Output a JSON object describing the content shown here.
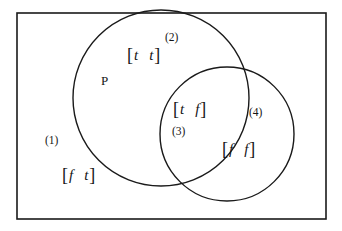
{
  "figure": {
    "type": "venn-euler-diagram",
    "background_color": "#ffffff",
    "stroke_color": "#1a1a1a",
    "universe": {
      "shape": "rectangle",
      "x": 17,
      "y": 13,
      "width": 309,
      "height": 206,
      "stroke_width": 1.6
    },
    "circles": [
      {
        "name": "left-circle",
        "label": "P",
        "cx": 161,
        "cy": 98,
        "r": 88,
        "stroke_width": 1.4
      },
      {
        "name": "right-circle",
        "label": "",
        "cx": 227,
        "cy": 134,
        "r": 67,
        "stroke_width": 1.4
      }
    ],
    "set_label": {
      "text": "P",
      "x": 101,
      "y": 74
    },
    "regions": [
      {
        "id": "1",
        "number_text": "(1)",
        "number_x": 45,
        "number_y": 135,
        "pair_text": "[f  t]",
        "left_bracket": "[",
        "right_bracket": "]",
        "first_value": "f",
        "second_value": "t",
        "pair_x": 62,
        "pair_y": 166,
        "description": "outside both circles"
      },
      {
        "id": "2",
        "number_text": "(2)",
        "number_x": 165,
        "number_y": 32,
        "pair_text": "[t  t]",
        "left_bracket": "[",
        "right_bracket": "]",
        "first_value": "t",
        "second_value": "t",
        "pair_x": 127,
        "pair_y": 46,
        "description": "inside left circle only"
      },
      {
        "id": "3",
        "number_text": "(3)",
        "number_x": 172,
        "number_y": 126,
        "pair_text": "[t  f]",
        "left_bracket": "[",
        "right_bracket": "]",
        "first_value": "t",
        "second_value": "f",
        "pair_x": 173,
        "pair_y": 100,
        "description": "intersection of both circles"
      },
      {
        "id": "4",
        "number_text": "(4)",
        "number_x": 249,
        "number_y": 107,
        "pair_text": "[f  f]",
        "left_bracket": "[",
        "right_bracket": "]",
        "first_value": "f",
        "second_value": "f",
        "pair_x": 222,
        "pair_y": 140,
        "description": "inside right circle only"
      }
    ]
  }
}
